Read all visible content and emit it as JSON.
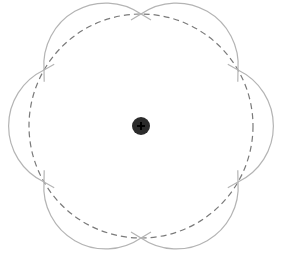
{
  "diagram": {
    "type": "hexagonal-petal-figure",
    "center": {
      "x": 141,
      "y": 126
    },
    "dashed_circle_radius": 112,
    "vertex_count": 6,
    "petal_arc_radius": 62,
    "colors": {
      "background": "#ffffff",
      "petal_stroke": "#b4b4b4",
      "dashed_stroke": "#7a7a7a",
      "center_fill": "#2b2b2b",
      "center_plus": "#000000"
    },
    "center_marker": {
      "icon": "plus-in-circle",
      "radius": 9
    }
  }
}
